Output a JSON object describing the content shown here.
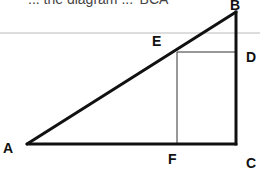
{
  "figure": {
    "header_text_cut_off": "... the diagram ... 'BCA'",
    "vertices": {
      "A": {
        "label": "A",
        "x": 27,
        "y": 144
      },
      "B": {
        "label": "B",
        "x": 236,
        "y": 12
      },
      "C": {
        "label": "C",
        "x": 236,
        "y": 144
      },
      "D": {
        "label": "D",
        "x": 236,
        "y": 52
      },
      "E": {
        "label": "E",
        "x": 177,
        "y": 52
      },
      "F": {
        "label": "F",
        "x": 177,
        "y": 144
      }
    },
    "segments": [
      {
        "from": "A",
        "to": "B",
        "weight": "thick"
      },
      {
        "from": "B",
        "to": "C",
        "weight": "thick"
      },
      {
        "from": "A",
        "to": "C",
        "weight": "thick"
      },
      {
        "from": "E",
        "to": "D",
        "weight": "thin"
      },
      {
        "from": "E",
        "to": "F",
        "weight": "thin"
      }
    ],
    "separator_line": {
      "y": 33,
      "color": "#bbbbbb"
    },
    "colors": {
      "line": "#111111",
      "thin_line": "#333333",
      "label": "#111111"
    }
  }
}
